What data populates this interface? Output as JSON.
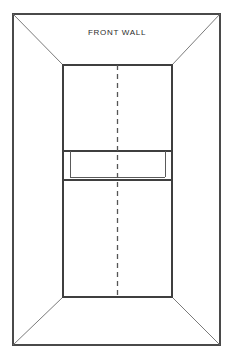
{
  "diagram": {
    "title": "FRONT WALL",
    "type": "court-perspective-diagram",
    "colors": {
      "background": "#ffffff",
      "outer_frame": "#4a4a4a",
      "perspective_edge": "#6b6b6b",
      "wall_outline": "#3f3f3f",
      "center_line": "#555555",
      "label": "#2b2b2b"
    },
    "canvas": {
      "width": 234,
      "height": 363
    },
    "outer_frame": {
      "left": 13,
      "top": 14,
      "right": 220,
      "bottom": 345
    },
    "front_wall": {
      "left": 63,
      "top": 65,
      "right": 172,
      "bottom": 297
    },
    "perspective_edges": [
      {
        "name": "top-left-diagonal",
        "x1": 13,
        "y1": 14,
        "x2": 63,
        "y2": 65
      },
      {
        "name": "top-right-diagonal",
        "x1": 220,
        "y1": 14,
        "x2": 172,
        "y2": 65
      },
      {
        "name": "bottom-left-diagonal",
        "x1": 13,
        "y1": 345,
        "x2": 63,
        "y2": 297
      },
      {
        "name": "bottom-right-diagonal",
        "x1": 220,
        "y1": 345,
        "x2": 172,
        "y2": 297
      }
    ],
    "service_band": {
      "name": "service-band",
      "top_y": 151,
      "bottom_y": 180,
      "inner_line_y": 177,
      "left_x": 63,
      "right_x": 172,
      "left_inset_x": 70,
      "right_inset_x": 165
    },
    "center_line": {
      "name": "center-service-line",
      "x": 117.5,
      "y1": 65,
      "y2": 297,
      "dash": "5 4"
    },
    "label_position": {
      "x": 117,
      "y": 33
    }
  },
  "chart_data": {
    "type": "diagram",
    "title": "FRONT WALL",
    "elements": [
      {
        "label": "outer room frame",
        "shape": "rectangle"
      },
      {
        "label": "front wall face",
        "shape": "rectangle"
      },
      {
        "label": "perspective diagonals",
        "shape": "lines",
        "count": 4
      },
      {
        "label": "service band",
        "shape": "rectangle"
      },
      {
        "label": "center service line",
        "shape": "dashed-line"
      }
    ]
  }
}
